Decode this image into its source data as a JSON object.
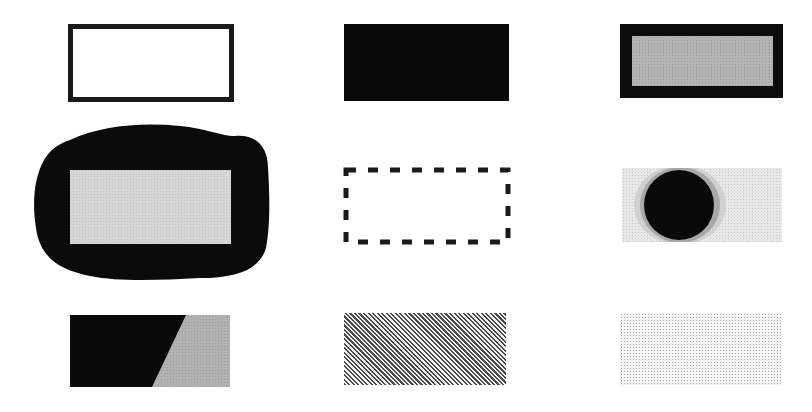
{
  "figure": {
    "colors": {
      "black": "#0a0a0a",
      "mid_gray": "#b4b4b4",
      "light_gray": "#d8d8d8",
      "white": "#ffffff"
    },
    "swatches": [
      {
        "row": 1,
        "col": 1,
        "style": "outlined-rectangle"
      },
      {
        "row": 1,
        "col": 2,
        "style": "solid-black-rectangle"
      },
      {
        "row": 1,
        "col": 3,
        "style": "gray-rectangle-with-black-frame"
      },
      {
        "row": 2,
        "col": 1,
        "style": "gray-rectangle-inside-black-blob"
      },
      {
        "row": 2,
        "col": 2,
        "style": "dashed-outline-rectangle"
      },
      {
        "row": 2,
        "col": 3,
        "style": "black-circle-with-gray-halo-on-dotted-field"
      },
      {
        "row": 3,
        "col": 1,
        "style": "diagonal-split-black-gray-rectangle"
      },
      {
        "row": 3,
        "col": 2,
        "style": "diagonal-hatched-rectangle"
      },
      {
        "row": 3,
        "col": 3,
        "style": "light-dotted-rectangle"
      }
    ]
  }
}
